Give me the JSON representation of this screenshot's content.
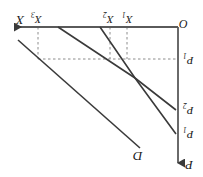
{
  "figure": {
    "caption_fragment": "—— ——— —— —— —",
    "rotation_degrees": 180,
    "background_color": "#ffffff",
    "ink_color": "#3a3a3a",
    "dash_color": "#8c8c8c",
    "width": 203,
    "height": 177
  },
  "axes": {
    "origin": {
      "label": "O",
      "x": 178,
      "y": 27
    },
    "horizontal": {
      "name": "x-axis",
      "label": "X",
      "label_x": 16,
      "label_y": 14,
      "y": 27,
      "from_x": 178,
      "to_x": 10,
      "arrow": "left"
    },
    "vertical": {
      "name": "p-axis",
      "label": "P",
      "label_x": 185,
      "label_y": 160,
      "x": 178,
      "from_y": 27,
      "to_y": 167,
      "arrow": "down"
    }
  },
  "ticks": {
    "x_ticks": [
      {
        "label": "X",
        "sub": "3",
        "x": 38,
        "label_x": 31,
        "label_y": 14
      },
      {
        "label": "X",
        "sub": "2",
        "x": 110,
        "label_x": 103,
        "label_y": 14
      },
      {
        "label": "X",
        "sub": "1",
        "x": 127,
        "label_x": 122,
        "label_y": 14
      }
    ],
    "p_ticks": [
      {
        "label": "P",
        "sub": "1",
        "y": 59,
        "label_x": 184,
        "label_y": 58
      },
      {
        "label": "P",
        "sub": "2",
        "y": 110,
        "label_x": 184,
        "label_y": 108
      },
      {
        "label": "P",
        "sub": "1",
        "y": 134,
        "label_x": 184,
        "label_y": 132
      }
    ]
  },
  "guides": {
    "vertical_dashed": [
      {
        "name": "dash-x3",
        "x": 38,
        "from_y": 27,
        "to_y": 59
      },
      {
        "name": "dash-x2",
        "x": 110,
        "from_y": 27,
        "to_y": 59
      },
      {
        "name": "dash-x1",
        "x": 127,
        "from_y": 27,
        "to_y": 59
      }
    ],
    "horizontal_dashed": [
      {
        "name": "dash-p1",
        "y": 59,
        "from_x": 38,
        "to_x": 178
      }
    ]
  },
  "curves": [
    {
      "name": "demand-curve-d",
      "label": "D",
      "label_x": 134,
      "label_y": 156,
      "points": [
        [
          18,
          40
        ],
        [
          140,
          148
        ]
      ]
    },
    {
      "name": "curve-through-x3",
      "label": "",
      "points": [
        [
          58,
          27
        ],
        [
          135,
          78
        ],
        [
          176,
          110
        ]
      ]
    },
    {
      "name": "curve-through-x2",
      "label": "",
      "points": [
        [
          100,
          27
        ],
        [
          135,
          78
        ],
        [
          176,
          134
        ]
      ]
    }
  ]
}
